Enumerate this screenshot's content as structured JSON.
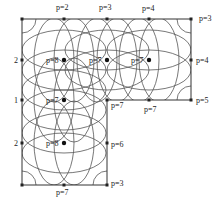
{
  "diagram": {
    "title": "",
    "grid_x": [
      22,
      64,
      107,
      149,
      191
    ],
    "grid_y": [
      19,
      60,
      100,
      143,
      185
    ],
    "line_color": "#333333",
    "arc_color": "#555555",
    "outline": [
      [
        22,
        19
      ],
      [
        191,
        19
      ],
      [
        191,
        100
      ],
      [
        107,
        100
      ],
      [
        107,
        185
      ],
      [
        22,
        185
      ]
    ],
    "boundary_nodes": [
      {
        "x": 22,
        "y": 19
      },
      {
        "x": 64,
        "y": 19
      },
      {
        "x": 107,
        "y": 19
      },
      {
        "x": 149,
        "y": 19
      },
      {
        "x": 191,
        "y": 19
      },
      {
        "x": 191,
        "y": 60
      },
      {
        "x": 191,
        "y": 100
      },
      {
        "x": 149,
        "y": 100
      },
      {
        "x": 107,
        "y": 100
      },
      {
        "x": 107,
        "y": 143
      },
      {
        "x": 107,
        "y": 185
      },
      {
        "x": 64,
        "y": 185
      },
      {
        "x": 22,
        "y": 185
      },
      {
        "x": 22,
        "y": 143
      },
      {
        "x": 22,
        "y": 100
      },
      {
        "x": 22,
        "y": 60
      }
    ],
    "interior_nodes": [
      {
        "x": 64,
        "y": 60
      },
      {
        "x": 107,
        "y": 60
      },
      {
        "x": 149,
        "y": 60
      },
      {
        "x": 64,
        "y": 100
      },
      {
        "x": 64,
        "y": 143
      }
    ],
    "labels": [
      {
        "text": "p=2",
        "x": 56,
        "y": 4
      },
      {
        "text": "p=3",
        "x": 99,
        "y": 4
      },
      {
        "text": "p=4",
        "x": 142,
        "y": 5
      },
      {
        "text": "p=3",
        "x": 199,
        "y": 15
      },
      {
        "text": "p=4",
        "x": 196,
        "y": 57
      },
      {
        "text": "p=5",
        "x": 196,
        "y": 97
      },
      {
        "text": "p=7",
        "x": 111,
        "y": 102
      },
      {
        "text": "p=7",
        "x": 144,
        "y": 106
      },
      {
        "text": "p=6",
        "x": 111,
        "y": 141
      },
      {
        "text": "p=3",
        "x": 111,
        "y": 180
      },
      {
        "text": "2",
        "x": 14,
        "y": 57
      },
      {
        "text": "1",
        "x": 14,
        "y": 97
      },
      {
        "text": "2",
        "x": 14,
        "y": 140
      },
      {
        "text": "p=8",
        "x": 46,
        "y": 57
      },
      {
        "text": "p=7",
        "x": 89,
        "y": 57
      },
      {
        "text": "p=7",
        "x": 131,
        "y": 57
      },
      {
        "text": "p=7",
        "x": 46,
        "y": 97
      },
      {
        "text": "p=8",
        "x": 46,
        "y": 140
      },
      {
        "text": "p=7",
        "x": 56,
        "y": 189
      }
    ]
  }
}
